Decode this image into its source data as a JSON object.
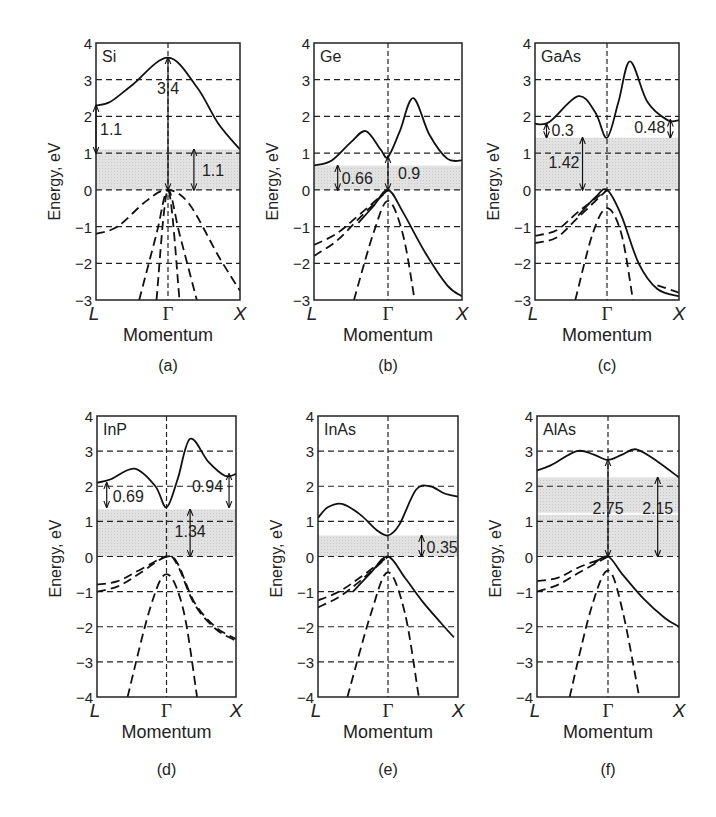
{
  "figure": {
    "y_axis_label": "Energy, eV",
    "x_axis_label": "Momentum",
    "k_points": [
      "L",
      "Γ",
      "X"
    ]
  },
  "chart_data": [
    {
      "type": "line",
      "panel_label": "(a)",
      "title": "Si",
      "xlabel": "Momentum",
      "ylabel": "Energy, eV",
      "x_ticks": [
        "L",
        "Γ",
        "X"
      ],
      "ylim": [
        -3,
        4
      ],
      "y_ticks": [
        4,
        3,
        2,
        1,
        0,
        -1,
        -2,
        -3
      ],
      "grid": "dashed horizontal",
      "bandgap_band": [
        0,
        1.1
      ],
      "conduction_band": {
        "x": [
          0,
          0.1,
          0.25,
          0.5,
          0.7,
          0.85,
          1.0
        ],
        "y": [
          2.3,
          2.4,
          2.85,
          3.6,
          2.8,
          1.8,
          1.1
        ]
      },
      "valence_bands": [
        {
          "style": "dashed",
          "x": [
            0,
            0.15,
            0.35,
            0.5,
            0.65,
            0.85,
            1.0
          ],
          "y": [
            -1.2,
            -1.0,
            -0.3,
            0,
            -0.4,
            -1.8,
            -2.75
          ]
        },
        {
          "style": "dashed",
          "x": [
            0.3,
            0.42,
            0.5,
            0.58,
            0.7
          ],
          "y": [
            -3,
            -1.2,
            0,
            -1.2,
            -3
          ]
        },
        {
          "style": "dashed",
          "x": [
            0.42,
            0.5,
            0.58
          ],
          "y": [
            -3,
            0,
            -3
          ]
        }
      ],
      "annotations": [
        {
          "text": "1.1",
          "from": [
            0.0,
            1.0
          ],
          "to": [
            0.0,
            2.3
          ]
        },
        {
          "text": "3.4",
          "from": [
            0.5,
            0
          ],
          "to": [
            0.5,
            3.6
          ]
        },
        {
          "text": "1.1",
          "from": [
            0.68,
            0
          ],
          "to": [
            0.68,
            1.1
          ]
        }
      ]
    },
    {
      "type": "line",
      "panel_label": "(b)",
      "title": "Ge",
      "xlabel": "Momentum",
      "ylabel": "Energy, eV",
      "x_ticks": [
        "L",
        "Γ",
        "X"
      ],
      "ylim": [
        -3,
        4
      ],
      "y_ticks": [
        4,
        3,
        2,
        1,
        0,
        -1,
        -2,
        -3
      ],
      "grid": "dashed horizontal",
      "bandgap_band": [
        0,
        0.66
      ],
      "conduction_band": {
        "x": [
          0,
          0.12,
          0.25,
          0.35,
          0.45,
          0.5,
          0.58,
          0.67,
          0.78,
          0.9,
          1.0
        ],
        "y": [
          0.66,
          0.8,
          1.3,
          1.6,
          1.1,
          0.9,
          1.6,
          2.5,
          1.5,
          0.85,
          0.8
        ]
      },
      "valence_bands": [
        {
          "style": "solid",
          "x": [
            0.3,
            0.4,
            0.5,
            0.6,
            0.75,
            0.9,
            1.0
          ],
          "y": [
            -0.9,
            -0.45,
            0,
            -0.6,
            -1.7,
            -2.6,
            -2.9
          ]
        },
        {
          "style": "dashed",
          "x": [
            0,
            0.15,
            0.3,
            0.5
          ],
          "y": [
            -1.5,
            -1.2,
            -0.7,
            0
          ]
        },
        {
          "style": "dashed",
          "x": [
            0,
            0.15,
            0.3,
            0.5
          ],
          "y": [
            -1.8,
            -1.4,
            -0.8,
            0
          ]
        },
        {
          "style": "dashed",
          "x": [
            0.27,
            0.4,
            0.5,
            0.6,
            0.68
          ],
          "y": [
            -3,
            -1.2,
            -0.3,
            -1.2,
            -3
          ]
        }
      ],
      "annotations": [
        {
          "text": "0.66",
          "from": [
            0.16,
            0
          ],
          "to": [
            0.16,
            0.66
          ]
        },
        {
          "text": "0.9",
          "from": [
            0.5,
            0
          ],
          "to": [
            0.5,
            0.9
          ]
        }
      ]
    },
    {
      "type": "line",
      "panel_label": "(c)",
      "title": "GaAs",
      "xlabel": "Momentum",
      "ylabel": "Energy, eV",
      "x_ticks": [
        "L",
        "Γ",
        "X"
      ],
      "ylim": [
        -3,
        4
      ],
      "y_ticks": [
        4,
        3,
        2,
        1,
        0,
        -1,
        -2,
        -3
      ],
      "grid": "dashed horizontal",
      "bandgap_band": [
        0,
        1.42
      ],
      "conduction_band": {
        "x": [
          0,
          0.1,
          0.3,
          0.42,
          0.5,
          0.58,
          0.66,
          0.78,
          0.92,
          1.0
        ],
        "y": [
          1.8,
          1.85,
          2.55,
          2.1,
          1.42,
          2.4,
          3.5,
          2.4,
          1.9,
          1.9
        ]
      },
      "valence_bands": [
        {
          "style": "solid",
          "x": [
            0.3,
            0.42,
            0.5,
            0.6,
            0.72,
            0.85,
            1.0
          ],
          "y": [
            -0.7,
            -0.2,
            0,
            -0.7,
            -2.0,
            -2.7,
            -2.9
          ]
        },
        {
          "style": "dashed",
          "x": [
            0,
            0.15,
            0.3,
            0.5
          ],
          "y": [
            -1.25,
            -1.1,
            -0.6,
            0
          ]
        },
        {
          "style": "dashed",
          "x": [
            0,
            0.15,
            0.3,
            0.5
          ],
          "y": [
            -1.45,
            -1.3,
            -0.75,
            0
          ]
        },
        {
          "style": "dashed",
          "x": [
            0.85,
            1.0
          ],
          "y": [
            -2.6,
            -2.8
          ]
        },
        {
          "style": "dashed",
          "x": [
            0.28,
            0.4,
            0.5,
            0.6,
            0.68
          ],
          "y": [
            -3,
            -1.2,
            -0.5,
            -1.2,
            -3
          ]
        }
      ],
      "annotations": [
        {
          "text": "0.3",
          "from": [
            0.08,
            1.42
          ],
          "to": [
            0.08,
            1.8
          ]
        },
        {
          "text": "1.42",
          "from": [
            0.33,
            0
          ],
          "to": [
            0.33,
            1.42
          ]
        },
        {
          "text": "0.48",
          "from": [
            0.94,
            1.42
          ],
          "to": [
            0.94,
            1.9
          ]
        }
      ]
    },
    {
      "type": "line",
      "panel_label": "(d)",
      "title": "InP",
      "xlabel": "Momentum",
      "ylabel": "Energy, eV",
      "x_ticks": [
        "L",
        "Γ",
        "X"
      ],
      "ylim": [
        -4,
        4
      ],
      "y_ticks": [
        4,
        3,
        2,
        1,
        0,
        -1,
        -2,
        -3,
        -4
      ],
      "grid": "dashed horizontal",
      "bandgap_band": [
        0,
        1.34
      ],
      "conduction_band": {
        "x": [
          0,
          0.1,
          0.27,
          0.42,
          0.5,
          0.58,
          0.67,
          0.8,
          0.92,
          1.0
        ],
        "y": [
          2.1,
          2.2,
          2.5,
          2.0,
          1.4,
          2.2,
          3.35,
          2.7,
          2.3,
          2.35
        ]
      },
      "valence_bands": [
        {
          "style": "dashed",
          "x": [
            0,
            0.15,
            0.3,
            0.5,
            0.58,
            0.7,
            0.85,
            1.0
          ],
          "y": [
            -0.8,
            -0.7,
            -0.4,
            0,
            -0.2,
            -1.3,
            -2.0,
            -2.35
          ]
        },
        {
          "style": "dashed",
          "x": [
            0,
            0.15,
            0.3,
            0.5,
            0.58,
            0.7,
            0.85,
            1.0
          ],
          "y": [
            -1.0,
            -0.85,
            -0.5,
            0,
            -0.25,
            -1.35,
            -2.05,
            -2.4
          ]
        },
        {
          "style": "dashed",
          "x": [
            0.22,
            0.38,
            0.5,
            0.62,
            0.72
          ],
          "y": [
            -4,
            -1.5,
            -0.5,
            -1.5,
            -4
          ]
        }
      ],
      "annotations": [
        {
          "text": "0.69",
          "from": [
            0.07,
            1.4
          ],
          "to": [
            0.07,
            2.1
          ]
        },
        {
          "text": "0.94",
          "from": [
            0.95,
            1.4
          ],
          "to": [
            0.95,
            2.35
          ]
        },
        {
          "text": "1.34",
          "from": [
            0.67,
            0
          ],
          "to": [
            0.67,
            1.34
          ]
        }
      ]
    },
    {
      "type": "line",
      "panel_label": "(e)",
      "title": "InAs",
      "xlabel": "Momentum",
      "ylabel": "Energy, eV",
      "x_ticks": [
        "L",
        "Γ",
        "X"
      ],
      "ylim": [
        -4,
        4
      ],
      "y_ticks": [
        4,
        3,
        2,
        1,
        0,
        -1,
        -2,
        -3,
        -4
      ],
      "grid": "dashed horizontal",
      "bandgap_band": [
        0,
        0.6
      ],
      "conduction_band": {
        "x": [
          0,
          0.07,
          0.17,
          0.3,
          0.42,
          0.5,
          0.58,
          0.7,
          0.8,
          0.9,
          1.0
        ],
        "y": [
          1.1,
          1.4,
          1.5,
          1.2,
          0.75,
          0.6,
          0.9,
          1.9,
          2.0,
          1.8,
          1.7
        ]
      },
      "valence_bands": [
        {
          "style": "solid",
          "x": [
            0.25,
            0.38,
            0.5,
            0.62,
            0.75,
            0.88,
            0.97
          ],
          "y": [
            -1.0,
            -0.45,
            0,
            -0.6,
            -1.3,
            -1.9,
            -2.3
          ]
        },
        {
          "style": "dashed",
          "x": [
            0,
            0.15,
            0.3,
            0.5
          ],
          "y": [
            -1.25,
            -1.0,
            -0.6,
            0
          ]
        },
        {
          "style": "dashed",
          "x": [
            0,
            0.15,
            0.3,
            0.5
          ],
          "y": [
            -1.45,
            -1.15,
            -0.7,
            0
          ]
        },
        {
          "style": "dashed",
          "x": [
            0.21,
            0.38,
            0.5,
            0.62,
            0.72
          ],
          "y": [
            -4,
            -1.6,
            -0.45,
            -1.6,
            -4
          ]
        }
      ],
      "annotations": [
        {
          "text": "0.35",
          "from": [
            0.74,
            0
          ],
          "to": [
            0.74,
            0.6
          ]
        }
      ]
    },
    {
      "type": "line",
      "panel_label": "(f)",
      "title": "AlAs",
      "xlabel": "Momentum",
      "ylabel": "Energy, eV",
      "x_ticks": [
        "L",
        "Γ",
        "X"
      ],
      "ylim": [
        -4,
        4
      ],
      "y_ticks": [
        4,
        3,
        2,
        1,
        0,
        -1,
        -2,
        -3,
        -4
      ],
      "grid": "dashed horizontal",
      "bandgap_band": [
        0,
        2.25
      ],
      "conduction_band": {
        "x": [
          0,
          0.1,
          0.28,
          0.4,
          0.5,
          0.6,
          0.7,
          0.85,
          1.0
        ],
        "y": [
          2.45,
          2.6,
          3.0,
          2.9,
          2.75,
          2.9,
          3.05,
          2.7,
          2.25
        ]
      },
      "valence_bands": [
        {
          "style": "solid",
          "x": [
            0.4,
            0.5,
            0.6,
            0.75,
            0.9,
            1.0
          ],
          "y": [
            -0.2,
            0,
            -0.5,
            -1.2,
            -1.75,
            -2.0
          ]
        },
        {
          "style": "dashed",
          "x": [
            0,
            0.15,
            0.3,
            0.5
          ],
          "y": [
            -0.7,
            -0.6,
            -0.3,
            0
          ]
        },
        {
          "style": "dashed",
          "x": [
            0,
            0.15,
            0.3,
            0.5
          ],
          "y": [
            -1.0,
            -0.8,
            -0.45,
            0
          ]
        },
        {
          "style": "dashed",
          "x": [
            0.23,
            0.38,
            0.5,
            0.6,
            0.72
          ],
          "y": [
            -4,
            -1.5,
            -0.4,
            -1.5,
            -4
          ]
        }
      ],
      "annotations": [
        {
          "text": "2.75",
          "from": [
            0.5,
            0
          ],
          "to": [
            0.5,
            2.75
          ]
        },
        {
          "text": "2.15",
          "from": [
            0.85,
            0
          ],
          "to": [
            0.85,
            2.25
          ]
        }
      ]
    }
  ]
}
